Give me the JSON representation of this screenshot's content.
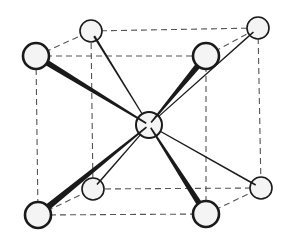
{
  "diagram": {
    "title": "",
    "type": "body-centered cubic unit cell",
    "colors": {
      "background": "#ffffff",
      "edge": "#555555",
      "bond": "#1a1a1a",
      "atom_fill": "#f4f4f4",
      "atom_stroke": "#1a1a1a"
    },
    "atoms": [
      {
        "id": "back-top-left",
        "x": 91,
        "y": 31,
        "r": 11,
        "stroke": 1.6
      },
      {
        "id": "back-top-right",
        "x": 258,
        "y": 28,
        "r": 11,
        "stroke": 1.6
      },
      {
        "id": "back-bottom-left",
        "x": 93,
        "y": 189,
        "r": 11,
        "stroke": 1.6
      },
      {
        "id": "back-bottom-right",
        "x": 261,
        "y": 188,
        "r": 11,
        "stroke": 1.6
      },
      {
        "id": "front-top-left",
        "x": 36,
        "y": 56,
        "r": 13,
        "stroke": 2.6
      },
      {
        "id": "front-top-right",
        "x": 206,
        "y": 56,
        "r": 13,
        "stroke": 2.6
      },
      {
        "id": "front-bottom-left",
        "x": 38,
        "y": 215,
        "r": 13,
        "stroke": 2.6
      },
      {
        "id": "front-bottom-right",
        "x": 206,
        "y": 214,
        "r": 13,
        "stroke": 2.6
      },
      {
        "id": "center",
        "x": 149,
        "y": 125,
        "r": 13,
        "stroke": 2.0
      }
    ],
    "edges": [
      [
        "back-top-left",
        "back-top-right"
      ],
      [
        "back-top-right",
        "back-bottom-right"
      ],
      [
        "back-bottom-right",
        "back-bottom-left"
      ],
      [
        "back-bottom-left",
        "back-top-left"
      ],
      [
        "front-top-left",
        "front-top-right"
      ],
      [
        "front-top-right",
        "front-bottom-right"
      ],
      [
        "front-bottom-right",
        "front-bottom-left"
      ],
      [
        "front-bottom-left",
        "front-top-left"
      ],
      [
        "front-top-left",
        "back-top-left"
      ],
      [
        "front-top-right",
        "back-top-right"
      ],
      [
        "front-bottom-left",
        "back-bottom-left"
      ],
      [
        "front-bottom-right",
        "back-bottom-right"
      ]
    ],
    "bonds": [
      {
        "from": "back-top-left",
        "w_start": 2.2,
        "w_end": 1.2
      },
      {
        "from": "back-top-right",
        "w_start": 1.6,
        "w_end": 1.2
      },
      {
        "from": "back-bottom-left",
        "w_start": 1.6,
        "w_end": 1.2
      },
      {
        "from": "back-bottom-right",
        "w_start": 1.6,
        "w_end": 1.2
      },
      {
        "from": "front-top-left",
        "w_start": 6.0,
        "w_end": 1.6
      },
      {
        "from": "front-top-right",
        "w_start": 6.0,
        "w_end": 1.6
      },
      {
        "from": "front-bottom-left",
        "w_start": 6.5,
        "w_end": 1.6
      },
      {
        "from": "front-bottom-right",
        "w_start": 6.0,
        "w_end": 1.6
      }
    ],
    "bond_target": "center"
  }
}
